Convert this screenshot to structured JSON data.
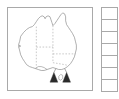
{
  "figure": {
    "type": "outline-map",
    "frame_color": "#a9a9a9",
    "background_color": "#ffffff"
  },
  "map": {
    "name": "australia-outline-map",
    "coastline_color": "#8a8a8a",
    "state_border_color": "#b0b0b0",
    "state_border_style": "dashed",
    "fill_color": "#ffffff",
    "islands": [
      {
        "name": "tasmania"
      }
    ],
    "annotations": {
      "marker_color": "#2b2b2b",
      "markers": [
        {
          "name": "arrow-marker-left",
          "shape": "arrowhead",
          "direction": "up"
        },
        {
          "name": "arrow-marker-right",
          "shape": "arrowhead",
          "direction": "up"
        }
      ]
    }
  },
  "legend": {
    "name": "legend-column",
    "cell_count": 7,
    "cell_border_color": "#a9a9a9",
    "cells": [
      {
        "label": "",
        "color": "#ffffff"
      },
      {
        "label": "",
        "color": "#ffffff"
      },
      {
        "label": "",
        "color": "#ffffff"
      },
      {
        "label": "",
        "color": "#ffffff"
      },
      {
        "label": "",
        "color": "#ffffff"
      },
      {
        "label": "",
        "color": "#ffffff"
      },
      {
        "label": "",
        "color": "#ffffff"
      }
    ]
  }
}
